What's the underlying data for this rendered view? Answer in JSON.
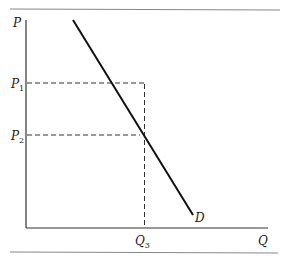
{
  "diagram": {
    "type": "supply-demand",
    "axes": {
      "y_label": "P",
      "x_label": "Q"
    },
    "price_levels": [
      {
        "label": "P",
        "sub": "1"
      },
      {
        "label": "P",
        "sub": "2"
      }
    ],
    "quantity_levels": [
      {
        "label": "Q",
        "sub": "3"
      }
    ],
    "curves": [
      {
        "label": "D",
        "name": "demand"
      }
    ],
    "colors": {
      "line": "#1a1a1a",
      "rule": "#888888",
      "dashed": "#333333"
    }
  }
}
